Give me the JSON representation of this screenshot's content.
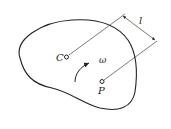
{
  "diagram": {
    "type": "rigid-body-rotation",
    "labels": {
      "center": "C",
      "point": "P",
      "angular_velocity": "ω",
      "distance": "l"
    },
    "colors": {
      "stroke": "#222222",
      "background": "#ffffff"
    }
  }
}
